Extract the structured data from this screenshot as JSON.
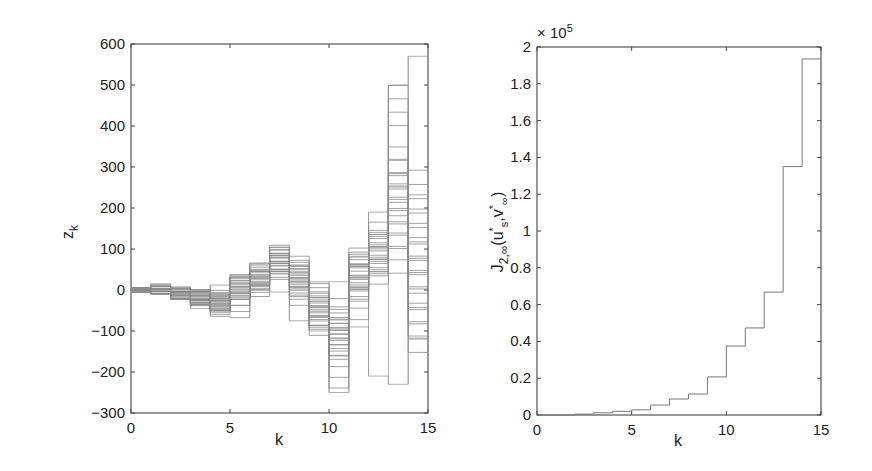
{
  "chart_data": [
    {
      "id": "left",
      "type": "line",
      "style": "stairs",
      "title": "",
      "xlabel": "k",
      "ylabel": "z_k",
      "xlim": [
        0,
        15
      ],
      "ylim": [
        -300,
        600
      ],
      "xticks": [
        0,
        5,
        10,
        15
      ],
      "yticks": [
        -300,
        -200,
        -100,
        0,
        100,
        200,
        300,
        400,
        500,
        600
      ],
      "grid": false,
      "description": "Ensemble of many gray staircase trajectories z_k for k=0..15",
      "x": [
        0,
        1,
        2,
        3,
        4,
        5,
        6,
        7,
        8,
        9,
        10,
        11,
        12,
        13,
        14,
        15
      ],
      "envelope_upper": [
        5,
        0,
        -8,
        -5,
        12,
        35,
        45,
        80,
        60,
        20,
        20,
        80,
        190,
        500,
        570
      ],
      "envelope_lower": [
        0,
        -10,
        -22,
        -45,
        -50,
        -5,
        10,
        -5,
        -75,
        -100,
        -250,
        -90,
        -210,
        -230,
        -120
      ],
      "series": [
        {
          "name": "trace 1",
          "values": [
            5,
            -8,
            -15,
            -25,
            10,
            30,
            70,
            40,
            -40,
            -60,
            60,
            90,
            450,
            180
          ]
        },
        {
          "name": "trace 2",
          "values": [
            0,
            -10,
            -20,
            -35,
            5,
            25,
            75,
            20,
            -20,
            -120,
            40,
            100,
            300,
            240
          ]
        },
        {
          "name": "trace 3",
          "values": [
            0,
            -8,
            -18,
            -40,
            -15,
            35,
            80,
            10,
            -60,
            -130,
            20,
            80,
            230,
            100
          ]
        },
        {
          "name": "trace 4",
          "values": [
            0,
            -10,
            -22,
            -20,
            0,
            40,
            60,
            50,
            -50,
            -80,
            50,
            60,
            150,
            20
          ]
        },
        {
          "name": "trace 5",
          "values": [
            5,
            -5,
            -15,
            -30,
            15,
            20,
            75,
            -5,
            -75,
            -200,
            -30,
            120,
            90,
            -60
          ]
        },
        {
          "name": "trace 6",
          "values": [
            0,
            -8,
            -18,
            -45,
            -45,
            10,
            55,
            25,
            -30,
            -110,
            15,
            85,
            210,
            -100
          ]
        },
        {
          "name": "trace 7",
          "values": [
            0,
            -10,
            -20,
            -28,
            8,
            38,
            68,
            35,
            -55,
            -95,
            45,
            95,
            270,
            60
          ]
        }
      ]
    },
    {
      "id": "right",
      "type": "line",
      "style": "stairs",
      "title": "",
      "xlabel": "k",
      "ylabel": "J_{2,∞}(u*_s, v*_∞)",
      "xlim": [
        0,
        15
      ],
      "ylim": [
        0,
        200000
      ],
      "y_multiplier": "× 10^5",
      "xticks": [
        0,
        5,
        10,
        15
      ],
      "yticks": [
        0,
        0.2,
        0.4,
        0.6,
        0.8,
        1,
        1.2,
        1.4,
        1.6,
        1.8,
        2
      ],
      "grid": false,
      "x": [
        0,
        1,
        2,
        3,
        4,
        5,
        6,
        7,
        8,
        9,
        10,
        11,
        12,
        13,
        14,
        15
      ],
      "values": [
        0,
        0,
        500,
        1200,
        2000,
        2800,
        5400,
        8700,
        11400,
        20700,
        37500,
        47300,
        66800,
        135000,
        193500
      ],
      "values_scaled_1e5": [
        0,
        0,
        0.005,
        0.012,
        0.02,
        0.028,
        0.054,
        0.087,
        0.114,
        0.207,
        0.375,
        0.473,
        0.668,
        1.35,
        1.935
      ]
    }
  ],
  "labels": {
    "left_xlabel": "k",
    "left_ylabel_main": "z",
    "left_ylabel_sub": "k",
    "right_xlabel": "k",
    "right_multiplier_prefix": "× 10",
    "right_multiplier_exp": "5"
  }
}
